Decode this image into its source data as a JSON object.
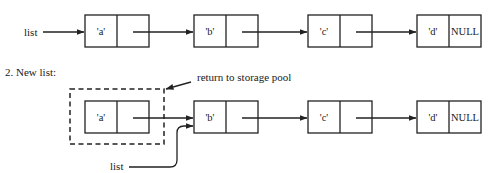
{
  "diagram": {
    "type": "linked-list-deletion",
    "row1": {
      "pointer_label": "list",
      "nodes": [
        {
          "value": "'a'",
          "next": ""
        },
        {
          "value": "'b'",
          "next": ""
        },
        {
          "value": "'c'",
          "next": ""
        },
        {
          "value": "'d'",
          "next": "NULL"
        }
      ]
    },
    "row2": {
      "heading": "2. New list:",
      "annotation": "return to storage pool",
      "pointer_label": "list",
      "nodes": [
        {
          "value": "'a'",
          "next": ""
        },
        {
          "value": "'b'",
          "next": ""
        },
        {
          "value": "'c'",
          "next": ""
        },
        {
          "value": "'d'",
          "next": "NULL"
        }
      ]
    }
  }
}
